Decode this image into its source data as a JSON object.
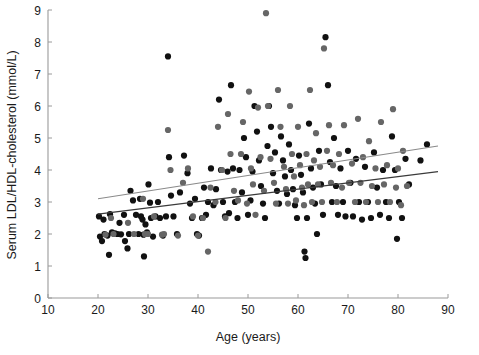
{
  "chart_data": {
    "type": "scatter",
    "title": "",
    "xlabel": "Age (years)",
    "ylabel": "Serum LDL/HDL-cholesterol  (mmol/L)",
    "xlim": [
      10,
      90
    ],
    "ylim": [
      0,
      9
    ],
    "xticks": [
      10,
      20,
      30,
      40,
      50,
      60,
      70,
      80,
      90
    ],
    "yticks": [
      0,
      1,
      2,
      3,
      4,
      5,
      6,
      7,
      8,
      9
    ],
    "grid": false,
    "legend": "none",
    "series": [
      {
        "name": "series-dark",
        "color": "#111111",
        "marker": "circle",
        "points": [
          [
            20.2,
            2.55
          ],
          [
            20.4,
            1.92
          ],
          [
            20.8,
            1.78
          ],
          [
            21.1,
            2.45
          ],
          [
            21.3,
            2.0
          ],
          [
            21.9,
            1.95
          ],
          [
            22.2,
            1.35
          ],
          [
            22.4,
            2.62
          ],
          [
            22.8,
            2.05
          ],
          [
            23.4,
            2.02
          ],
          [
            23.9,
            2.0
          ],
          [
            24.3,
            2.35
          ],
          [
            24.6,
            1.99
          ],
          [
            25.2,
            2.6
          ],
          [
            25.4,
            1.78
          ],
          [
            25.9,
            1.55
          ],
          [
            26.2,
            2.0
          ],
          [
            26.5,
            3.35
          ],
          [
            27.0,
            3.05
          ],
          [
            27.6,
            2.6
          ],
          [
            28.1,
            2.0
          ],
          [
            28.4,
            3.1
          ],
          [
            28.6,
            2.55
          ],
          [
            28.9,
            2.45
          ],
          [
            29.1,
            1.98
          ],
          [
            29.2,
            1.3
          ],
          [
            29.5,
            2.3
          ],
          [
            29.8,
            2.05
          ],
          [
            30.1,
            3.55
          ],
          [
            30.4,
            2.98
          ],
          [
            30.6,
            2.5
          ],
          [
            31.0,
            1.92
          ],
          [
            31.5,
            2.55
          ],
          [
            32.0,
            3.0
          ],
          [
            32.4,
            2.5
          ],
          [
            33.0,
            1.95
          ],
          [
            33.6,
            2.55
          ],
          [
            34.0,
            7.55
          ],
          [
            34.2,
            4.4
          ],
          [
            34.6,
            3.2
          ],
          [
            35.1,
            2.55
          ],
          [
            35.8,
            2.0
          ],
          [
            36.4,
            3.3
          ],
          [
            37.2,
            4.45
          ],
          [
            37.9,
            3.9
          ],
          [
            38.4,
            2.95
          ],
          [
            38.8,
            2.5
          ],
          [
            39.4,
            3.1
          ],
          [
            39.8,
            2.0
          ],
          [
            40.2,
            1.95
          ],
          [
            40.8,
            2.5
          ],
          [
            41.2,
            3.45
          ],
          [
            41.6,
            2.6
          ],
          [
            42.0,
            3.0
          ],
          [
            42.6,
            4.05
          ],
          [
            43.1,
            2.9
          ],
          [
            43.6,
            3.4
          ],
          [
            44.2,
            6.2
          ],
          [
            44.6,
            4.0
          ],
          [
            45.0,
            3.0
          ],
          [
            45.4,
            2.55
          ],
          [
            45.9,
            3.95
          ],
          [
            46.2,
            2.65
          ],
          [
            46.6,
            6.65
          ],
          [
            47.0,
            4.05
          ],
          [
            47.4,
            3.0
          ],
          [
            47.9,
            2.5
          ],
          [
            48.3,
            4.0
          ],
          [
            48.8,
            3.3
          ],
          [
            49.2,
            5.0
          ],
          [
            49.6,
            4.4
          ],
          [
            50.0,
            2.6
          ],
          [
            50.5,
            3.05
          ],
          [
            50.9,
            3.95
          ],
          [
            51.3,
            6.0
          ],
          [
            51.8,
            5.2
          ],
          [
            52.2,
            4.3
          ],
          [
            52.6,
            3.5
          ],
          [
            53.0,
            2.95
          ],
          [
            53.4,
            2.5
          ],
          [
            53.9,
            4.75
          ],
          [
            54.2,
            6.0
          ],
          [
            54.6,
            5.35
          ],
          [
            55.0,
            3.9
          ],
          [
            55.4,
            4.55
          ],
          [
            55.8,
            3.35
          ],
          [
            56.2,
            2.95
          ],
          [
            56.6,
            5.05
          ],
          [
            57.0,
            4.3
          ],
          [
            57.4,
            3.8
          ],
          [
            57.8,
            3.25
          ],
          [
            58.2,
            4.8
          ],
          [
            58.6,
            4.0
          ],
          [
            59.0,
            3.4
          ],
          [
            59.4,
            2.9
          ],
          [
            59.8,
            2.5
          ],
          [
            60.2,
            4.45
          ],
          [
            60.6,
            3.85
          ],
          [
            61.0,
            3.3
          ],
          [
            61.3,
            1.45
          ],
          [
            61.5,
            1.25
          ],
          [
            61.8,
            2.5
          ],
          [
            62.2,
            5.45
          ],
          [
            62.6,
            4.05
          ],
          [
            63.0,
            3.45
          ],
          [
            63.4,
            2.95
          ],
          [
            63.8,
            2.0
          ],
          [
            64.2,
            4.6
          ],
          [
            64.6,
            3.55
          ],
          [
            65.0,
            2.6
          ],
          [
            65.5,
            8.15
          ],
          [
            66.0,
            6.65
          ],
          [
            66.4,
            4.25
          ],
          [
            66.8,
            3.0
          ],
          [
            67.2,
            5.0
          ],
          [
            67.6,
            3.5
          ],
          [
            68.0,
            2.6
          ],
          [
            68.5,
            4.05
          ],
          [
            69.0,
            3.0
          ],
          [
            69.5,
            2.55
          ],
          [
            70.0,
            4.6
          ],
          [
            70.5,
            3.6
          ],
          [
            71.0,
            2.55
          ],
          [
            71.6,
            4.35
          ],
          [
            72.2,
            3.0
          ],
          [
            72.8,
            2.45
          ],
          [
            73.4,
            4.1
          ],
          [
            74.0,
            3.0
          ],
          [
            74.6,
            2.5
          ],
          [
            75.2,
            4.55
          ],
          [
            75.8,
            3.45
          ],
          [
            76.4,
            2.6
          ],
          [
            77.0,
            4.0
          ],
          [
            77.6,
            3.0
          ],
          [
            78.2,
            2.5
          ],
          [
            78.8,
            5.05
          ],
          [
            79.4,
            4.0
          ],
          [
            79.8,
            1.85
          ],
          [
            80.2,
            3.0
          ],
          [
            80.8,
            2.5
          ],
          [
            81.5,
            4.35
          ],
          [
            82.2,
            3.55
          ],
          [
            84.5,
            4.3
          ],
          [
            85.8,
            4.8
          ]
        ]
      },
      {
        "name": "series-gray",
        "color": "#666666",
        "marker": "circle",
        "points": [
          [
            21.5,
            1.98
          ],
          [
            22.6,
            2.5
          ],
          [
            23.1,
            2.0
          ],
          [
            26.0,
            2.35
          ],
          [
            27.2,
            2.0
          ],
          [
            29.0,
            3.1
          ],
          [
            29.4,
            2.0
          ],
          [
            30.0,
            2.0
          ],
          [
            31.2,
            2.55
          ],
          [
            32.8,
            1.98
          ],
          [
            33.2,
            2.0
          ],
          [
            34.0,
            5.25
          ],
          [
            34.5,
            4.0
          ],
          [
            36.0,
            1.95
          ],
          [
            37.0,
            3.6
          ],
          [
            38.0,
            4.05
          ],
          [
            39.0,
            2.55
          ],
          [
            40.0,
            1.95
          ],
          [
            41.0,
            2.5
          ],
          [
            42.0,
            1.45
          ],
          [
            42.5,
            3.45
          ],
          [
            43.5,
            3.0
          ],
          [
            44.0,
            5.35
          ],
          [
            44.8,
            4.0
          ],
          [
            45.5,
            2.5
          ],
          [
            46.0,
            5.75
          ],
          [
            46.5,
            4.5
          ],
          [
            47.2,
            3.35
          ],
          [
            48.0,
            3.05
          ],
          [
            48.6,
            4.5
          ],
          [
            49.0,
            5.5
          ],
          [
            49.8,
            2.95
          ],
          [
            50.2,
            6.45
          ],
          [
            50.6,
            4.05
          ],
          [
            51.0,
            3.55
          ],
          [
            51.5,
            2.6
          ],
          [
            52.0,
            5.95
          ],
          [
            52.5,
            4.4
          ],
          [
            53.2,
            3.35
          ],
          [
            53.6,
            8.9
          ],
          [
            54.0,
            6.0
          ],
          [
            54.5,
            4.35
          ],
          [
            55.2,
            3.6
          ],
          [
            55.6,
            2.95
          ],
          [
            56.0,
            6.5
          ],
          [
            56.5,
            5.35
          ],
          [
            57.2,
            4.1
          ],
          [
            57.6,
            3.4
          ],
          [
            58.0,
            2.95
          ],
          [
            58.4,
            6.0
          ],
          [
            58.8,
            4.5
          ],
          [
            59.2,
            3.8
          ],
          [
            59.6,
            3.05
          ],
          [
            60.0,
            5.35
          ],
          [
            60.4,
            4.15
          ],
          [
            60.8,
            3.45
          ],
          [
            61.2,
            2.9
          ],
          [
            61.7,
            4.5
          ],
          [
            62.0,
            3.55
          ],
          [
            62.4,
            6.5
          ],
          [
            62.8,
            3.0
          ],
          [
            63.2,
            4.3
          ],
          [
            63.6,
            5.15
          ],
          [
            64.0,
            3.55
          ],
          [
            64.4,
            4.1
          ],
          [
            64.8,
            3.0
          ],
          [
            65.2,
            7.8
          ],
          [
            65.8,
            4.6
          ],
          [
            66.2,
            5.4
          ],
          [
            66.6,
            3.6
          ],
          [
            67.0,
            4.15
          ],
          [
            67.8,
            3.0
          ],
          [
            68.2,
            4.5
          ],
          [
            68.8,
            3.45
          ],
          [
            69.2,
            5.4
          ],
          [
            70.2,
            3.6
          ],
          [
            70.8,
            4.2
          ],
          [
            71.4,
            3.0
          ],
          [
            72.0,
            5.6
          ],
          [
            72.5,
            3.6
          ],
          [
            73.0,
            4.4
          ],
          [
            73.6,
            3.0
          ],
          [
            74.2,
            4.9
          ],
          [
            74.8,
            3.5
          ],
          [
            75.5,
            4.05
          ],
          [
            76.0,
            3.0
          ],
          [
            76.6,
            5.5
          ],
          [
            77.2,
            3.55
          ],
          [
            77.8,
            4.15
          ],
          [
            78.4,
            3.0
          ],
          [
            79.0,
            5.9
          ],
          [
            79.6,
            3.45
          ],
          [
            80.0,
            4.05
          ],
          [
            80.6,
            2.9
          ],
          [
            81.0,
            4.6
          ],
          [
            81.8,
            3.5
          ]
        ]
      }
    ],
    "regression_lines": [
      {
        "name": "upper-trend-line",
        "color": "#8a8a8a",
        "x1": 20.0,
        "y1": 3.1,
        "x2": 88.0,
        "y2": 4.75
      },
      {
        "name": "lower-trend-line",
        "color": "#3a3a3a",
        "x1": 20.0,
        "y1": 2.62,
        "x2": 88.0,
        "y2": 3.95
      }
    ]
  },
  "caption": {
    "partial_line": ""
  }
}
